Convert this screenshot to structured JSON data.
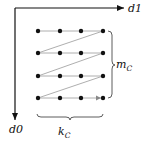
{
  "diagram": {
    "axes": {
      "horizontal": {
        "label": "d1"
      },
      "vertical": {
        "label": "d0"
      }
    },
    "grid": {
      "rows": 4,
      "cols": 4,
      "traversal": "row-major zigzag"
    },
    "braces": {
      "rows_label": {
        "main": "m",
        "sub": "C"
      },
      "cols_label": {
        "main": "k",
        "sub": "C"
      }
    },
    "colors": {
      "axis": "#111111",
      "dot": "#111111",
      "path": "#999999"
    }
  }
}
